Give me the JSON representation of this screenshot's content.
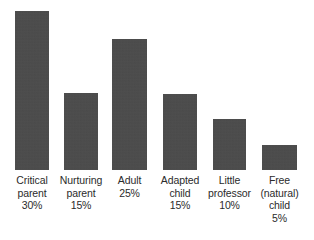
{
  "chart_data": {
    "type": "bar",
    "title": "",
    "subtitle": "",
    "xlabel": "",
    "ylabel": "",
    "ylim": [
      0,
      32
    ],
    "grid": false,
    "legend": "none",
    "orientation": "vertical",
    "bar_color": "#4a4a4a",
    "background_color": "#ffffff",
    "text_color": "#2b2b2b",
    "categories": [
      "Critical parent",
      "Nurturing parent",
      "Adult",
      "Adapted child",
      "Little professor",
      "Free (natural) child"
    ],
    "values": [
      30,
      15,
      25,
      15,
      10,
      5
    ],
    "value_labels": [
      "30%",
      "15%",
      "25%",
      "15%",
      "10%",
      "5%"
    ],
    "bars": [
      {
        "name": "critical-parent",
        "label_lines": [
          "Critical",
          "parent",
          "30%"
        ],
        "value": 30,
        "value_label": "30%",
        "x": 15,
        "width": 34,
        "height": 159
      },
      {
        "name": "nurturing-parent",
        "label_lines": [
          "Nurturing",
          "parent",
          "15%"
        ],
        "value": 15,
        "value_label": "15%",
        "x": 64,
        "width": 34,
        "height": 77
      },
      {
        "name": "adult",
        "label_lines": [
          "Adult",
          "25%"
        ],
        "value": 25,
        "value_label": "25%",
        "x": 112,
        "width": 35,
        "height": 131
      },
      {
        "name": "adapted-child",
        "label_lines": [
          "Adapted",
          "child",
          "15%"
        ],
        "value": 15,
        "value_label": "15%",
        "x": 163,
        "width": 34,
        "height": 76
      },
      {
        "name": "little-professor",
        "label_lines": [
          "Little",
          "professor",
          "10%"
        ],
        "value": 10,
        "value_label": "10%",
        "x": 213,
        "width": 33,
        "height": 51
      },
      {
        "name": "free-natural-child",
        "label_lines": [
          "Free",
          "(natural)",
          "child",
          "5%"
        ],
        "value": 5,
        "value_label": "5%",
        "x": 262,
        "width": 35,
        "height": 25
      }
    ]
  }
}
